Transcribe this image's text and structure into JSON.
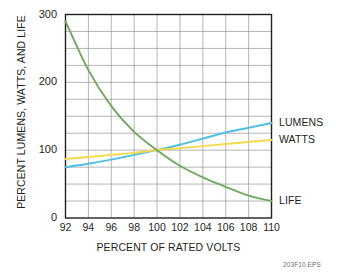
{
  "figure": {
    "id_label": "203F10.EPS"
  },
  "chart_data": {
    "type": "line",
    "title": "",
    "xlabel": "PERCENT OF RATED VOLTS",
    "ylabel": "PERCENT LUMENS, WATTS, AND LIFE",
    "xlim": [
      92,
      110
    ],
    "ylim": [
      0,
      300
    ],
    "xticks": [
      92,
      94,
      96,
      98,
      100,
      102,
      104,
      106,
      108,
      110
    ],
    "yticks": [
      0,
      100,
      200,
      300
    ],
    "ytick_labels": [
      "0",
      "100",
      "200",
      "300"
    ],
    "xtick_labels": [
      "92",
      "94",
      "96",
      "98",
      "100",
      "102",
      "104",
      "106",
      "108",
      "110"
    ],
    "grid": true,
    "grid_x_step": 2,
    "grid_y_step": 25,
    "legend_position": "right-of-axes",
    "x": [
      92,
      94,
      96,
      98,
      100,
      102,
      104,
      106,
      108,
      110
    ],
    "series": [
      {
        "name": "LUMENS",
        "color": "#4FBFE3",
        "values": [
          75,
          80,
          86,
          93,
          100,
          108,
          117,
          126,
          133,
          140
        ]
      },
      {
        "name": "WATTS",
        "color": "#F2D94E",
        "values": [
          87,
          90,
          93,
          96,
          100,
          103,
          106,
          109,
          112,
          115
        ]
      },
      {
        "name": "LIFE",
        "color": "#6FA95E",
        "values": [
          290,
          218,
          165,
          127,
          100,
          77,
          60,
          46,
          33,
          25
        ]
      }
    ],
    "annotations": [
      {
        "text": "LUMENS",
        "for_series": "LUMENS"
      },
      {
        "text": "WATTS",
        "for_series": "WATTS"
      },
      {
        "text": "LIFE",
        "for_series": "LIFE"
      }
    ]
  }
}
